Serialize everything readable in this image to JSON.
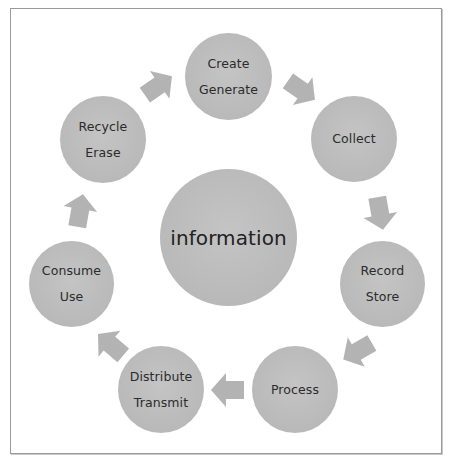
{
  "diagram": {
    "type": "cycle",
    "center": {
      "label": "information"
    },
    "stages": [
      {
        "id": "create",
        "lines": [
          "Create",
          "Generate"
        ]
      },
      {
        "id": "collect",
        "lines": [
          "Collect"
        ]
      },
      {
        "id": "record",
        "lines": [
          "Record",
          "Store"
        ]
      },
      {
        "id": "process",
        "lines": [
          "Process"
        ]
      },
      {
        "id": "distribute",
        "lines": [
          "Distribute",
          "Transmit"
        ]
      },
      {
        "id": "consume",
        "lines": [
          "Consume",
          "Use"
        ]
      },
      {
        "id": "recycle",
        "lines": [
          "Recycle",
          "Erase"
        ]
      }
    ],
    "flow": [
      {
        "from": "create",
        "to": "collect",
        "icon": "block-arrow-icon"
      },
      {
        "from": "collect",
        "to": "record",
        "icon": "block-arrow-icon"
      },
      {
        "from": "record",
        "to": "process",
        "icon": "block-arrow-icon"
      },
      {
        "from": "process",
        "to": "distribute",
        "icon": "block-arrow-icon"
      },
      {
        "from": "distribute",
        "to": "consume",
        "icon": "block-arrow-icon"
      },
      {
        "from": "consume",
        "to": "recycle",
        "icon": "block-arrow-icon"
      },
      {
        "from": "recycle",
        "to": "create",
        "icon": "block-arrow-icon"
      }
    ],
    "colors": {
      "node_fill": "#bcbcbc",
      "arrow_fill": "#b3b3b3",
      "text": "#2b2b2b",
      "border": "#9a9a9a"
    }
  }
}
